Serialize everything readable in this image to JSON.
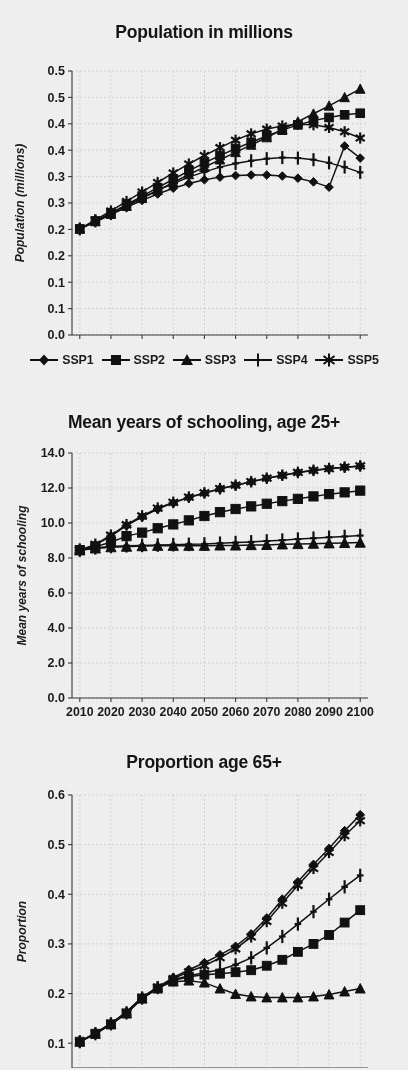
{
  "page": {
    "background_color": "#f1f1f1",
    "ink_color": "#111111",
    "grid_color": "#c9c9c9"
  },
  "legend": {
    "items": [
      {
        "label": "SSP1",
        "marker": "diamond-marker"
      },
      {
        "label": "SSP2",
        "marker": "square-marker"
      },
      {
        "label": "SSP3",
        "marker": "triangle-marker"
      },
      {
        "label": "SSP4",
        "marker": "plus-marker"
      },
      {
        "label": "SSP5",
        "marker": "asterisk-marker"
      }
    ]
  },
  "charts": [
    {
      "id": "population",
      "title": "Population in millions"
    },
    {
      "id": "schooling",
      "title": "Mean years of schooling, age 25+"
    },
    {
      "id": "age65",
      "title": "Proportion age 65+"
    }
  ],
  "chart_data": [
    {
      "type": "line",
      "id": "population",
      "title": "Population in millions",
      "xlabel": "",
      "ylabel": "Population (millions)",
      "x": [
        2010,
        2015,
        2020,
        2025,
        2030,
        2035,
        2040,
        2045,
        2050,
        2055,
        2060,
        2065,
        2070,
        2075,
        2080,
        2085,
        2090,
        2095,
        2100
      ],
      "xtick_labels": [
        "2010",
        "2020",
        "2030",
        "2040",
        "2050",
        "2060",
        "2070",
        "2080",
        "2090",
        "2100"
      ],
      "xticks": [
        2010,
        2020,
        2030,
        2040,
        2050,
        2060,
        2070,
        2080,
        2090,
        2100
      ],
      "xlim": [
        2007.5,
        2102.5
      ],
      "ylim": [
        0.0,
        0.5
      ],
      "yticks": [
        0.0,
        0.05,
        0.1,
        0.15,
        0.2,
        0.25,
        0.3,
        0.35,
        0.4,
        0.45,
        0.5
      ],
      "ytick_labels": [
        "0.0",
        "0.1",
        "0.1",
        "0.2",
        "0.2",
        "0.3",
        "0.3",
        "0.4",
        "0.4",
        "0.5",
        "0.5"
      ],
      "grid": true,
      "legend_position": "below",
      "series": [
        {
          "name": "SSP1",
          "marker": "diamond-marker",
          "values": [
            0.201,
            0.214,
            0.228,
            0.242,
            0.255,
            0.267,
            0.278,
            0.287,
            0.294,
            0.299,
            0.302,
            0.303,
            0.303,
            0.301,
            0.297,
            0.29,
            0.28,
            0.358,
            0.335
          ]
        },
        {
          "name": "SSP2",
          "marker": "square-marker",
          "values": [
            0.201,
            0.216,
            0.231,
            0.247,
            0.263,
            0.279,
            0.295,
            0.311,
            0.326,
            0.34,
            0.353,
            0.365,
            0.377,
            0.388,
            0.398,
            0.406,
            0.412,
            0.417,
            0.42
          ]
        },
        {
          "name": "SSP3",
          "marker": "triangle-marker",
          "values": [
            0.201,
            0.215,
            0.229,
            0.244,
            0.259,
            0.274,
            0.289,
            0.304,
            0.318,
            0.332,
            0.346,
            0.36,
            0.374,
            0.389,
            0.404,
            0.419,
            0.434,
            0.45,
            0.466
          ]
        },
        {
          "name": "SSP4",
          "marker": "plus-marker",
          "values": [
            0.201,
            0.216,
            0.23,
            0.245,
            0.26,
            0.274,
            0.287,
            0.299,
            0.309,
            0.318,
            0.325,
            0.33,
            0.334,
            0.336,
            0.335,
            0.332,
            0.326,
            0.318,
            0.308
          ]
        },
        {
          "name": "SSP5",
          "marker": "asterisk-marker",
          "values": [
            0.201,
            0.218,
            0.235,
            0.253,
            0.271,
            0.289,
            0.307,
            0.324,
            0.34,
            0.355,
            0.369,
            0.381,
            0.39,
            0.396,
            0.399,
            0.398,
            0.393,
            0.385,
            0.373
          ]
        }
      ]
    },
    {
      "type": "line",
      "id": "schooling",
      "title": "Mean years of schooling, age 25+",
      "xlabel": "",
      "ylabel": "Mean years of schooling",
      "x": [
        2010,
        2015,
        2020,
        2025,
        2030,
        2035,
        2040,
        2045,
        2050,
        2055,
        2060,
        2065,
        2070,
        2075,
        2080,
        2085,
        2090,
        2095,
        2100
      ],
      "xtick_labels": [
        "2010",
        "2020",
        "2030",
        "2040",
        "2050",
        "2060",
        "2070",
        "2080",
        "2090",
        "2100"
      ],
      "xticks": [
        2010,
        2020,
        2030,
        2040,
        2050,
        2060,
        2070,
        2080,
        2090,
        2100
      ],
      "xlim": [
        2007.5,
        2102.5
      ],
      "ylim": [
        0.0,
        14.0
      ],
      "yticks": [
        0.0,
        2.0,
        4.0,
        6.0,
        8.0,
        10.0,
        12.0,
        14.0
      ],
      "ytick_labels": [
        "0.0",
        "2.0",
        "4.0",
        "6.0",
        "8.0",
        "10.0",
        "12.0",
        "14.0"
      ],
      "grid": true,
      "legend_position": "shared-above",
      "series": [
        {
          "name": "SSP1",
          "marker": "diamond-marker",
          "values": [
            8.45,
            8.75,
            9.25,
            9.85,
            10.35,
            10.8,
            11.15,
            11.45,
            11.7,
            11.95,
            12.15,
            12.35,
            12.55,
            12.72,
            12.88,
            13.0,
            13.1,
            13.18,
            13.25
          ]
        },
        {
          "name": "SSP2",
          "marker": "square-marker",
          "values": [
            8.45,
            8.65,
            8.9,
            9.25,
            9.45,
            9.7,
            9.92,
            10.15,
            10.4,
            10.62,
            10.8,
            10.95,
            11.1,
            11.25,
            11.38,
            11.52,
            11.65,
            11.75,
            11.85
          ]
        },
        {
          "name": "SSP3",
          "marker": "triangle-marker",
          "values": [
            8.45,
            8.55,
            8.62,
            8.65,
            8.68,
            8.7,
            8.7,
            8.7,
            8.7,
            8.72,
            8.72,
            8.74,
            8.75,
            8.78,
            8.8,
            8.82,
            8.84,
            8.86,
            8.88
          ]
        },
        {
          "name": "SSP4",
          "marker": "plus-marker",
          "values": [
            8.45,
            8.58,
            8.66,
            8.7,
            8.72,
            8.74,
            8.76,
            8.78,
            8.8,
            8.84,
            8.88,
            8.92,
            8.97,
            9.02,
            9.08,
            9.13,
            9.18,
            9.23,
            9.28
          ]
        },
        {
          "name": "SSP5",
          "marker": "asterisk-marker",
          "values": [
            8.45,
            8.78,
            9.3,
            9.9,
            10.4,
            10.85,
            11.18,
            11.48,
            11.72,
            11.96,
            12.16,
            12.36,
            12.56,
            12.73,
            12.89,
            13.01,
            13.11,
            13.19,
            13.26
          ]
        }
      ]
    },
    {
      "type": "line",
      "id": "age65",
      "title": "Proportion age 65+",
      "xlabel": "",
      "ylabel": "Proportion",
      "x": [
        2010,
        2015,
        2020,
        2025,
        2030,
        2035,
        2040,
        2045,
        2050,
        2055,
        2060,
        2065,
        2070,
        2075,
        2080,
        2085,
        2090,
        2095,
        2100
      ],
      "xtick_labels": [
        "2010",
        "2020",
        "2030",
        "2040",
        "2050",
        "2060",
        "2070",
        "2080",
        "2090",
        "2100"
      ],
      "xticks": [
        2010,
        2020,
        2030,
        2040,
        2050,
        2060,
        2070,
        2080,
        2090,
        2100
      ],
      "xlim": [
        2007.5,
        2102.5
      ],
      "ylim": [
        0.05,
        0.6
      ],
      "yticks": [
        0.1,
        0.2,
        0.3,
        0.4,
        0.5,
        0.6
      ],
      "ytick_labels": [
        "0.1",
        "0.2",
        "0.3",
        "0.4",
        "0.5",
        "0.6"
      ],
      "grid": true,
      "legend_position": "shared-above",
      "series": [
        {
          "name": "SSP1",
          "marker": "diamond-marker",
          "values": [
            0.103,
            0.12,
            0.14,
            0.163,
            0.193,
            0.213,
            0.232,
            0.248,
            0.262,
            0.278,
            0.295,
            0.32,
            0.352,
            0.39,
            0.425,
            0.46,
            0.492,
            0.528,
            0.56
          ]
        },
        {
          "name": "SSP2",
          "marker": "square-marker",
          "values": [
            0.103,
            0.119,
            0.138,
            0.16,
            0.19,
            0.21,
            0.226,
            0.234,
            0.238,
            0.24,
            0.243,
            0.247,
            0.256,
            0.268,
            0.284,
            0.3,
            0.318,
            0.343,
            0.368
          ]
        },
        {
          "name": "SSP3",
          "marker": "triangle-marker",
          "values": [
            0.103,
            0.119,
            0.138,
            0.16,
            0.19,
            0.212,
            0.224,
            0.226,
            0.222,
            0.21,
            0.199,
            0.194,
            0.192,
            0.192,
            0.192,
            0.194,
            0.198,
            0.204,
            0.21
          ]
        },
        {
          "name": "SSP4",
          "marker": "plus-marker",
          "values": [
            0.103,
            0.119,
            0.139,
            0.161,
            0.191,
            0.212,
            0.228,
            0.236,
            0.242,
            0.248,
            0.258,
            0.272,
            0.292,
            0.315,
            0.34,
            0.365,
            0.39,
            0.415,
            0.438
          ]
        },
        {
          "name": "SSP5",
          "marker": "asterisk-marker",
          "values": [
            0.103,
            0.12,
            0.14,
            0.162,
            0.192,
            0.213,
            0.23,
            0.244,
            0.256,
            0.272,
            0.29,
            0.314,
            0.345,
            0.382,
            0.418,
            0.452,
            0.484,
            0.518,
            0.548
          ]
        }
      ]
    }
  ]
}
